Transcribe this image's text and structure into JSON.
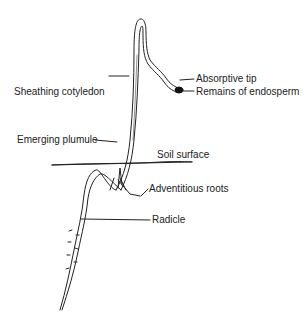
{
  "diagram": {
    "labels": {
      "absorptive_tip": "Absorptive tip",
      "remains_of_endosperm": "Remains of endosperm",
      "sheathing_cotyledon": "Sheathing cotyledon",
      "emerging_plumule": "Emerging plumule",
      "soil_surface": "Soil surface",
      "adventitious_roots": "Adventitious roots",
      "radicle": "Radicle"
    },
    "colors": {
      "line": "#222222",
      "endosperm": "#111111",
      "background": "#ffffff"
    }
  }
}
